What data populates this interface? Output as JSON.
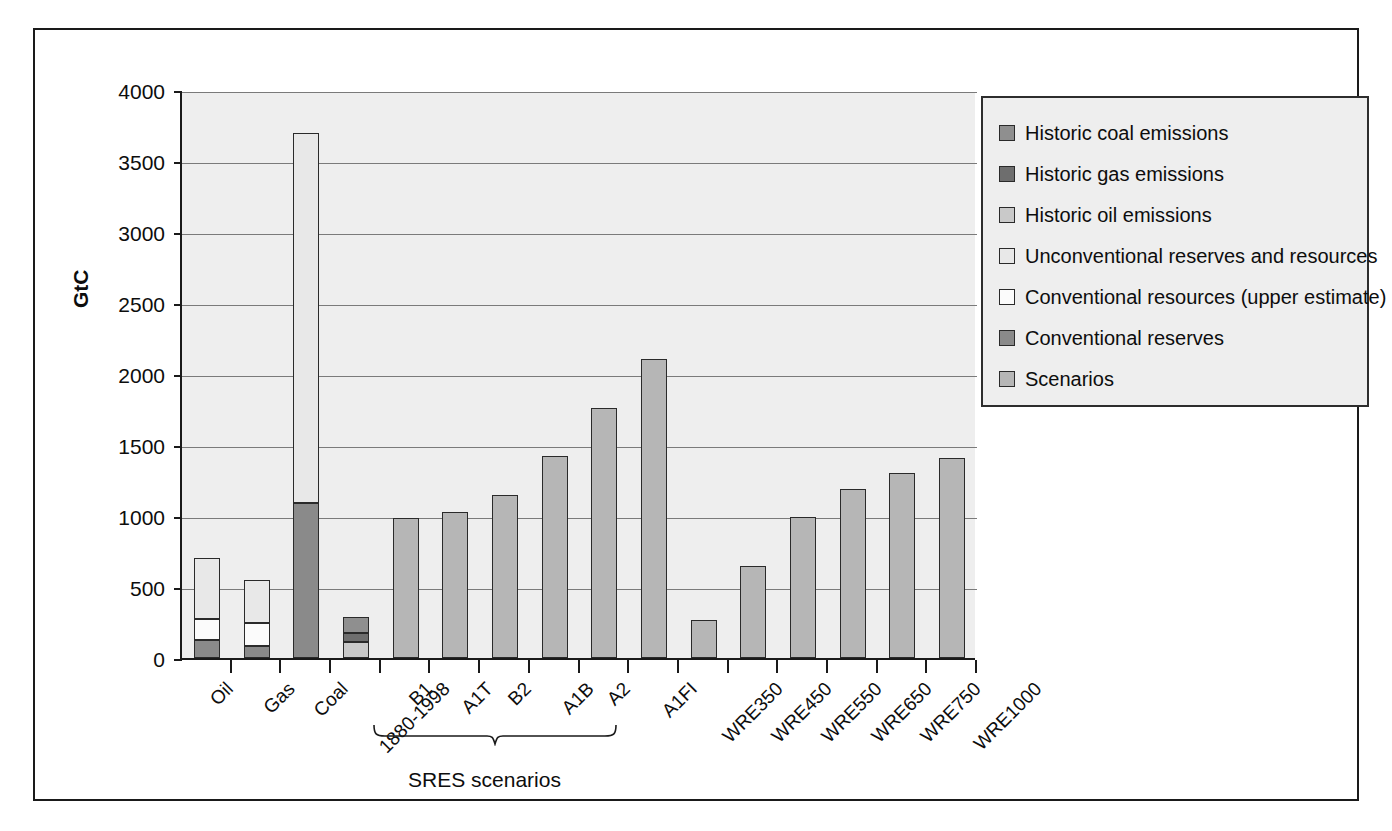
{
  "chart_data": {
    "type": "bar",
    "title": "",
    "xlabel": "",
    "ylabel": "GtC",
    "ylim": [
      0,
      4000
    ],
    "ytick_values": [
      0,
      500,
      1000,
      1500,
      2000,
      2500,
      3000,
      3500,
      4000
    ],
    "ytick_labels": [
      "0",
      "500",
      "1000",
      "1500",
      "2000",
      "2500",
      "3000",
      "3500",
      "4000"
    ],
    "grid": true,
    "stacked": true,
    "legend_position": "right",
    "categories": [
      "Oil",
      "Gas",
      "Coal",
      "1880-1998",
      "B1",
      "A1T",
      "B2",
      "A1B",
      "A2",
      "A1FI",
      "WRE350",
      "WRE450",
      "WRE550",
      "WRE650",
      "WRE750",
      "WRE1000"
    ],
    "series": [
      {
        "name": "Conventional reserves",
        "key": "conv_reserves",
        "color": "#8a8a8a",
        "values": [
          125,
          85,
          1090,
          null,
          null,
          null,
          null,
          null,
          null,
          null,
          null,
          null,
          null,
          null,
          null,
          null
        ]
      },
      {
        "name": "Conventional resources (upper estimate)",
        "key": "conv_resources",
        "color": "#fbfbfb",
        "values": [
          150,
          165,
          0,
          null,
          null,
          null,
          null,
          null,
          null,
          null,
          null,
          null,
          null,
          null,
          null,
          null
        ]
      },
      {
        "name": "Unconventional reserves and resources",
        "key": "unconventional",
        "color": "#e8e8e8",
        "values": [
          430,
          300,
          2610,
          null,
          null,
          null,
          null,
          null,
          null,
          null,
          null,
          null,
          null,
          null,
          null,
          null
        ]
      },
      {
        "name": "Historic oil emissions",
        "key": "historic_oil",
        "color": "#c9c9c9",
        "values": [
          null,
          null,
          null,
          110,
          null,
          null,
          null,
          null,
          null,
          null,
          null,
          null,
          null,
          null,
          null,
          null
        ]
      },
      {
        "name": "Historic gas emissions",
        "key": "historic_gas",
        "color": "#6e6e6e",
        "values": [
          null,
          null,
          null,
          65,
          null,
          null,
          null,
          null,
          null,
          null,
          null,
          null,
          null,
          null,
          null,
          null
        ]
      },
      {
        "name": "Historic coal emissions",
        "key": "historic_coal",
        "color": "#8f8f8f",
        "values": [
          null,
          null,
          null,
          115,
          null,
          null,
          null,
          null,
          null,
          null,
          null,
          null,
          null,
          null,
          null,
          null
        ]
      },
      {
        "name": "Scenarios",
        "key": "scenarios",
        "color": "#b6b6b6",
        "values": [
          null,
          null,
          null,
          null,
          985,
          1025,
          1150,
          1420,
          1760,
          2105,
          265,
          645,
          990,
          1190,
          1305,
          1410
        ]
      }
    ],
    "totals": [
      705,
      550,
      3700,
      290,
      985,
      1025,
      1150,
      1420,
      1760,
      2105,
      265,
      645,
      990,
      1190,
      1305,
      1410
    ],
    "annotations": [
      {
        "text": "SRES scenarios",
        "spans": [
          "B1",
          "A1FI"
        ],
        "type": "brace"
      }
    ]
  },
  "axis": {
    "y_title": "GtC",
    "y_ticks": [
      "4000",
      "3500",
      "3000",
      "2500",
      "2000",
      "1500",
      "1000",
      "500",
      "0"
    ],
    "x_labels": [
      "Oil",
      "Gas",
      "Coal",
      "1880-1998",
      "B1",
      "A1T",
      "B2",
      "A1B",
      "A2",
      "A1FI",
      "WRE350",
      "WRE450",
      "WRE550",
      "WRE650",
      "WRE750",
      "WRE1000"
    ]
  },
  "legend": {
    "items": [
      {
        "label": "Historic coal emissions",
        "color": "#8f8f8f",
        "swatch": "legend-swatch-historic-coal"
      },
      {
        "label": "Historic gas emissions",
        "color": "#6e6e6e",
        "swatch": "legend-swatch-historic-gas"
      },
      {
        "label": "Historic oil emissions",
        "color": "#c9c9c9",
        "swatch": "legend-swatch-historic-oil"
      },
      {
        "label": "Unconventional reserves and resources",
        "color": "#e8e8e8",
        "swatch": "legend-swatch-unconventional"
      },
      {
        "label": "Conventional resources (upper estimate)",
        "color": "#fbfbfb",
        "swatch": "legend-swatch-conventional-resources"
      },
      {
        "label": "Conventional reserves",
        "color": "#8a8a8a",
        "swatch": "legend-swatch-conventional-reserves"
      },
      {
        "label": "Scenarios",
        "color": "#b6b6b6",
        "swatch": "legend-swatch-scenarios"
      }
    ]
  },
  "annotation": {
    "sres_label": "SRES scenarios"
  },
  "colors": {
    "plot_background": "#eeeeee",
    "frame": "#1a1a1a",
    "gridline": "#7a7a7a",
    "text": "#0d0d0d"
  }
}
